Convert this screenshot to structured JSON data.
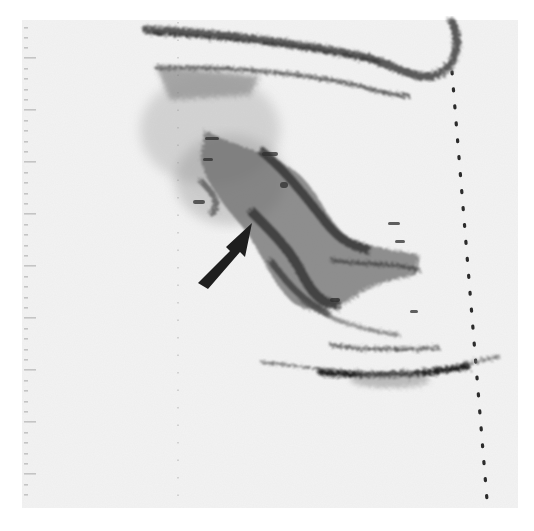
{
  "image": {
    "type": "ultrasound-scan",
    "rendering": "inverted grayscale (dark echoes on light background)",
    "background_color": "#f2f2f2",
    "echo_color": "#2a2a2a",
    "annotations": [
      {
        "kind": "arrow",
        "label": "",
        "tail": [
          198,
          282
        ],
        "head": [
          252,
          224
        ],
        "color": "#1e1e1e"
      }
    ],
    "depth_scale": {
      "position": "left",
      "x": 26,
      "y_start": 24,
      "y_end": 503,
      "tick_spacing": 10.5,
      "major_every": 5
    },
    "markers": {
      "center_dotted_line_x": 178,
      "right_dotted_line": {
        "x_top": 452,
        "y_top": 70,
        "x_bottom": 487,
        "y_bottom": 500
      }
    }
  }
}
